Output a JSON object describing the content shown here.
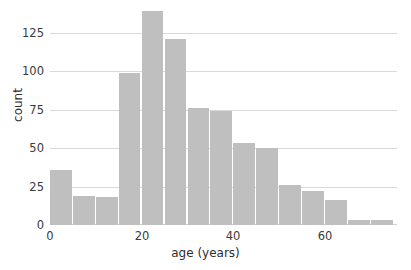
{
  "chart_data": {
    "type": "bar",
    "subtype": "histogram",
    "title": "",
    "xlabel": "age (years)",
    "ylabel": "count",
    "xlim": [
      0,
      75.7
    ],
    "ylim": [
      0,
      141
    ],
    "bin_width": 5,
    "grid": "horizontal",
    "legend": "none",
    "bar_color": "#bfbfbf",
    "grid_color": "#d9d9d9",
    "text_color": "#3a3a3a",
    "xticks": [
      0,
      20,
      40,
      60
    ],
    "xtick_labels": [
      "0",
      "20",
      "40",
      "60"
    ],
    "yticks": [
      0,
      25,
      50,
      75,
      100,
      125
    ],
    "ytick_labels": [
      "0",
      "25",
      "50",
      "75",
      "100",
      "125"
    ],
    "categories": [
      "0-5",
      "5-10",
      "10-15",
      "15-20",
      "20-25",
      "25-30",
      "30-35",
      "35-40",
      "40-45",
      "45-50",
      "50-55",
      "55-60",
      "60-65",
      "65-70",
      "70-75"
    ],
    "bin_starts": [
      0,
      5,
      10,
      15,
      20,
      25,
      30,
      35,
      40,
      45,
      50,
      55,
      60,
      65,
      70
    ],
    "bin_ends": [
      5,
      10,
      15,
      20,
      25,
      30,
      35,
      40,
      45,
      50,
      55,
      60,
      65,
      70,
      75
    ],
    "values": [
      36,
      19,
      18,
      99,
      139,
      121,
      76,
      74,
      53,
      50,
      26,
      22,
      16,
      3,
      3
    ]
  }
}
